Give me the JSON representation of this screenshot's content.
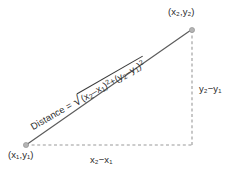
{
  "figure": {
    "background_color": "#ffffff",
    "line_color": "#5a5a5a",
    "dash_color": "#9a9a9a",
    "text_color": "#2b2b2b",
    "vertex_dot_color": "#a8a8a8"
  },
  "labels": {
    "point1": "(x₁,y₁)",
    "point2": "(x₂,y₂)",
    "horizontal_leg": "x₂−x₁",
    "vertical_leg": "y₂−y₁"
  },
  "formula": {
    "lhs": "Distance =",
    "radicand": "(x₂−x₁)² + (y₂−y₁)²",
    "radical_symbol": "√",
    "full": "Distance = √((x₂−x₁)² + (y₂−y₁)²)",
    "parts": {
      "term1_open": "(x",
      "term1_sub1": "2",
      "term1_minus": "–x",
      "term1_sub2": "1",
      "term1_close": ")",
      "term1_exp": "2",
      "plus": "+",
      "term2_open": "(y",
      "term2_sub1": "2",
      "term2_minus": "–y",
      "term2_sub2": "1",
      "term2_close": ")",
      "term2_exp": "2"
    }
  },
  "geometry": {
    "vertex_point1": [
      26,
      145
    ],
    "vertex_point2": [
      192,
      30
    ],
    "vertex_corner": [
      192,
      145
    ],
    "hypotenuse": "solid",
    "legs": "dashed"
  }
}
